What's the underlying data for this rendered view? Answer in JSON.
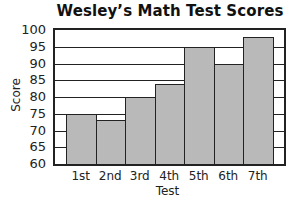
{
  "chart_data": {
    "type": "bar",
    "title": "Wesley’s Math Test Scores",
    "xlabel": "Test",
    "ylabel": "Score",
    "categories": [
      "1st",
      "2nd",
      "3rd",
      "4th",
      "5th",
      "6th",
      "7th"
    ],
    "values": [
      75,
      73,
      80,
      84,
      95,
      90,
      98
    ],
    "ylim": [
      60,
      100
    ],
    "yticks": [
      60,
      65,
      70,
      75,
      80,
      85,
      90,
      95,
      100
    ],
    "grid": true,
    "legend": null,
    "bar_color": "#b9b9b9"
  }
}
